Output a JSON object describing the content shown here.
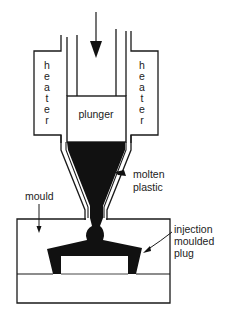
{
  "diagram": {
    "labels": {
      "heater_left": [
        "h",
        "e",
        "a",
        "t",
        "e",
        "r"
      ],
      "heater_right": [
        "h",
        "e",
        "a",
        "t",
        "e",
        "r"
      ],
      "plunger": "plunger",
      "molten_plastic_line1": "molten",
      "molten_plastic_line2": "plastic",
      "mould": "mould",
      "plug_line1": "injection",
      "plug_line2": "moulded",
      "plug_line3": "plug"
    },
    "colors": {
      "line": "#1a1a1a",
      "fill_dark": "#111111",
      "background": "#ffffff"
    }
  }
}
